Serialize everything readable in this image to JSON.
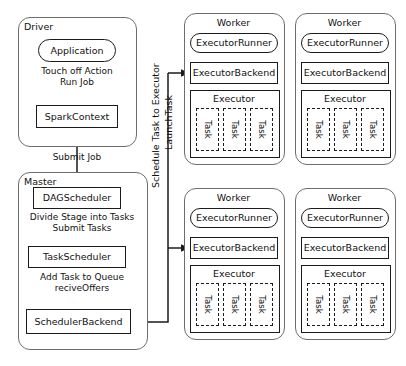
{
  "diagram": {
    "colors": {
      "stroke": "#1b1b1b",
      "group_stroke": "#6d6d6d",
      "background": "#ffffff"
    },
    "driver": {
      "label": "Driver",
      "application": "Application",
      "caption_touch_off": "Touch off Action\nRun Job",
      "spark_context": "SparkContext"
    },
    "submit_job_label": "Submit Job",
    "master": {
      "label": "Master",
      "dag_scheduler": "DAGScheduler",
      "caption_divide": "Divide Stage into Tasks\nSubmit Tasks",
      "task_scheduler": "TaskScheduler",
      "caption_add_task": "Add Task to Queue\nreciveOffers",
      "scheduler_backend": "SchedulerBackend"
    },
    "channel": {
      "line1": "Schedule Task to Executor",
      "line2": "LaunchTask"
    },
    "worker_template": {
      "label": "Worker",
      "executor_runner": "ExecutorRunner",
      "executor_backend": "ExecutorBackend",
      "executor": "Executor",
      "task": "Task"
    },
    "workers": [
      {
        "id": "worker-top-left",
        "label": "Worker",
        "executor_runner": "ExecutorRunner",
        "executor_backend": "ExecutorBackend",
        "executor": "Executor",
        "tasks": [
          "Task",
          "Task",
          "Task"
        ],
        "has_incoming_arrow": true
      },
      {
        "id": "worker-top-right",
        "label": "Worker",
        "executor_runner": "ExecutorRunner",
        "executor_backend": "ExecutorBackend",
        "executor": "Executor",
        "tasks": [
          "Task",
          "Task",
          "Task"
        ],
        "has_incoming_arrow": false
      },
      {
        "id": "worker-bottom-left",
        "label": "Worker",
        "executor_runner": "ExecutorRunner",
        "executor_backend": "ExecutorBackend",
        "executor": "Executor",
        "tasks": [
          "Task",
          "Task",
          "Task"
        ],
        "has_incoming_arrow": true
      },
      {
        "id": "worker-bottom-right",
        "label": "Worker",
        "executor_runner": "ExecutorRunner",
        "executor_backend": "ExecutorBackend",
        "executor": "Executor",
        "tasks": [
          "Task",
          "Task",
          "Task"
        ],
        "has_incoming_arrow": false
      }
    ]
  }
}
